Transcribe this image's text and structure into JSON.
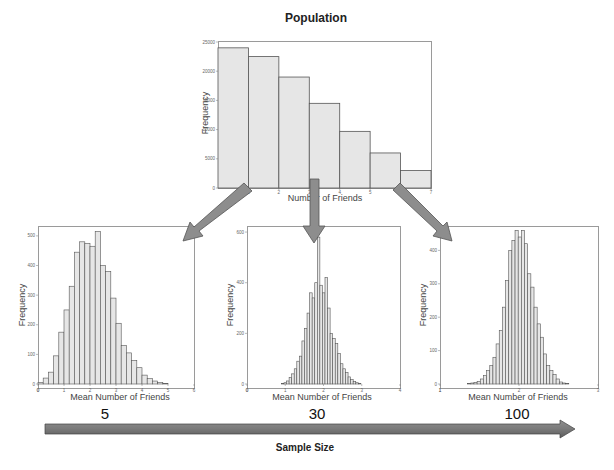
{
  "figure": {
    "population_title": "Population",
    "sample_size_label": "Sample Size",
    "colors": {
      "bar_fill": "#e6e6e6",
      "bar_stroke": "#555555",
      "arrow": "#8a8a8a",
      "arrow_dark": "#6d6d6d"
    }
  },
  "chart_data": [
    {
      "id": "population",
      "type": "bar",
      "title": "Population",
      "xlabel": "Number of Friends",
      "ylabel": "Frequency",
      "x_ticks": [
        "1",
        "2",
        "3",
        "4",
        "5",
        "6",
        "7"
      ],
      "y_ticks": [
        "0",
        "5000",
        "10000",
        "15000",
        "20000",
        "25000"
      ],
      "ylim": [
        0,
        25000
      ],
      "xlim": [
        0,
        7
      ],
      "bin_edges": [
        0,
        1,
        2,
        3,
        4,
        5,
        6,
        7
      ],
      "values": [
        24000,
        22500,
        19000,
        14500,
        9700,
        6000,
        3000
      ]
    },
    {
      "id": "sample_n5",
      "type": "bar",
      "title": "5",
      "xlabel": "Mean Number of Friends",
      "ylabel": "Frequency",
      "x_ticks": [
        "0",
        "1",
        "2",
        "3",
        "4",
        "5",
        "6"
      ],
      "y_ticks": [
        "0",
        "100",
        "200",
        "300",
        "400",
        "500"
      ],
      "xlim": [
        0,
        6
      ],
      "ylim": [
        0,
        530
      ],
      "bin_start": 0.0,
      "bin_width": 0.2,
      "values": [
        5,
        20,
        40,
        95,
        175,
        250,
        330,
        445,
        480,
        475,
        465,
        515,
        400,
        380,
        290,
        205,
        130,
        105,
        80,
        55,
        30,
        18,
        10,
        5,
        2
      ]
    },
    {
      "id": "sample_n30",
      "type": "bar",
      "title": "30",
      "xlabel": "Mean Number of Friends",
      "ylabel": "Frequency",
      "x_ticks": [
        "0",
        "1",
        "2",
        "3",
        "4"
      ],
      "y_ticks": [
        "0",
        "200",
        "400",
        "600"
      ],
      "xlim": [
        0,
        4
      ],
      "ylim": [
        0,
        620
      ],
      "bin_start": 0.9,
      "bin_width": 0.067,
      "values": [
        2,
        5,
        12,
        25,
        40,
        60,
        90,
        110,
        170,
        220,
        280,
        360,
        340,
        400,
        580,
        390,
        360,
        420,
        300,
        200,
        180,
        160,
        120,
        80,
        60,
        45,
        28,
        18,
        10,
        5,
        2
      ]
    },
    {
      "id": "sample_n100",
      "type": "bar",
      "title": "100",
      "xlabel": "Mean Number of Friends",
      "ylabel": "Frequency",
      "x_ticks": [
        "1",
        "2",
        "3"
      ],
      "y_ticks": [
        "0",
        "100",
        "200",
        "300",
        "400"
      ],
      "xlim": [
        1,
        3
      ],
      "ylim": [
        0,
        470
      ],
      "bin_start": 1.35,
      "bin_width": 0.04,
      "values": [
        2,
        3,
        5,
        8,
        15,
        25,
        40,
        55,
        80,
        120,
        160,
        230,
        310,
        400,
        430,
        460,
        440,
        460,
        420,
        330,
        290,
        230,
        180,
        140,
        90,
        55,
        40,
        28,
        15,
        6,
        3,
        1
      ]
    }
  ],
  "sample_sizes": [
    "5",
    "30",
    "100"
  ]
}
